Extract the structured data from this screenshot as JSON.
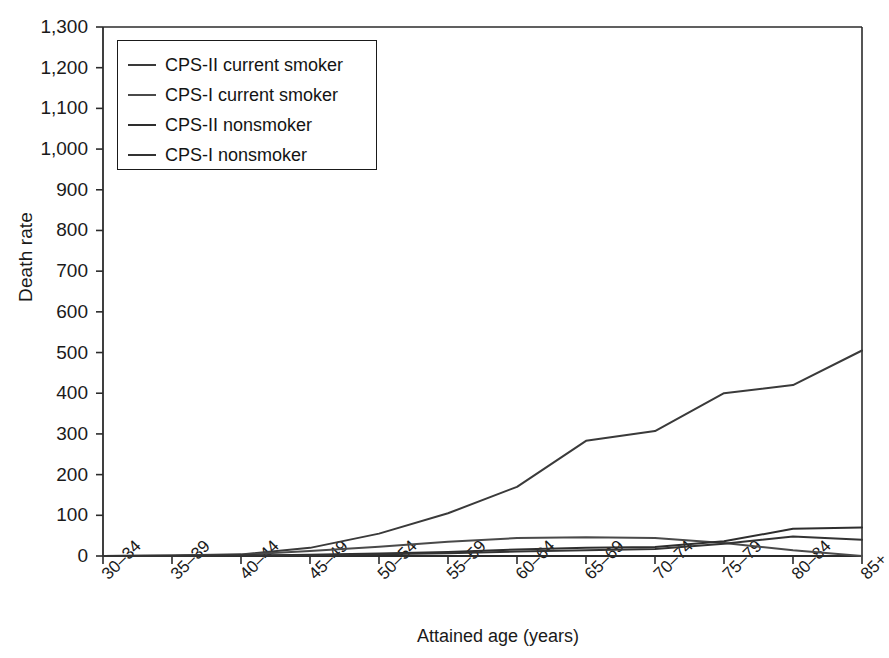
{
  "chart_data": {
    "type": "line",
    "title": "",
    "xlabel": "Attained age (years)",
    "ylabel": "Death rate",
    "categories": [
      "30–34",
      "35–39",
      "40–44",
      "45–49",
      "50–54",
      "55–59",
      "60–64",
      "65–69",
      "70–74",
      "75–79",
      "80–84",
      "85+"
    ],
    "ylim": [
      0,
      1300
    ],
    "ytick_labels": [
      "0",
      "100",
      "200",
      "300",
      "400",
      "500",
      "600",
      "700",
      "800",
      "900",
      "1,000",
      "1,100",
      "1,200",
      "1,300"
    ],
    "ytick_values": [
      0,
      100,
      200,
      300,
      400,
      500,
      600,
      700,
      800,
      900,
      1000,
      1100,
      1200,
      1300
    ],
    "grid": false,
    "legend_position": "upper-left",
    "series": [
      {
        "name": "CPS-II current smoker",
        "color": "#3a3a3a",
        "values": [
          0,
          1,
          4,
          20,
          55,
          105,
          170,
          283,
          307,
          400,
          420,
          505
        ]
      },
      {
        "name": "CPS-I current smoker",
        "color": "#4a4a4a",
        "values": [
          0,
          1,
          3,
          12,
          23,
          35,
          44,
          46,
          44,
          32,
          14,
          0
        ]
      },
      {
        "name": "CPS-II nonsmoker",
        "color": "#2e2e2e",
        "values": [
          0,
          0,
          1,
          3,
          6,
          10,
          16,
          20,
          22,
          36,
          67,
          70
        ]
      },
      {
        "name": "CPS-I nonsmoker",
        "color": "#333333",
        "values": [
          0,
          0,
          1,
          2,
          4,
          7,
          11,
          14,
          17,
          30,
          48,
          40
        ]
      }
    ]
  },
  "axes": {
    "plot_left": 103,
    "plot_right": 862,
    "plot_top": 27,
    "plot_bottom": 556
  }
}
